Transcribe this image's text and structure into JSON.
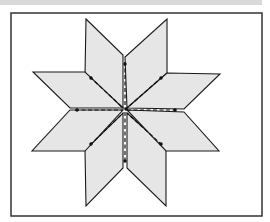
{
  "figure": {
    "frame": {
      "x": 11,
      "y": 13,
      "width": 251,
      "height": 203
    },
    "colors": {
      "background": "#ffffff",
      "top_strip": "#d9d9d9",
      "frame_stroke": "#333333",
      "diamond_fill": "#e6e6e6",
      "diamond_stroke": "#1a1a1a",
      "seam_stroke": "#111111"
    },
    "diamonds": [
      {
        "name": "diamond-upper-left-vertical",
        "points": "86,19 123,55 123,108 85,75"
      },
      {
        "name": "diamond-upper-right-vertical",
        "points": "167,19 167,73 127,108 125,57"
      },
      {
        "name": "diamond-lower-left-vertical",
        "points": "85,150 123,113 123,168 86,206"
      },
      {
        "name": "diamond-lower-right-vertical",
        "points": "127,113 166,148 166,206 127,168"
      },
      {
        "name": "diamond-upper-left-horizontal",
        "points": "33,72 85,72 123,108 70,108"
      },
      {
        "name": "diamond-upper-right-horizontal",
        "points": "167,73 220,74 184,109 127,108"
      },
      {
        "name": "diamond-lower-left-horizontal",
        "points": "70,110 123,110 85,151 32,151"
      },
      {
        "name": "diamond-lower-right-horizontal",
        "points": "127,110 184,112 219,151 166,151"
      }
    ],
    "seams": [
      {
        "name": "seam-vertical-top",
        "x1": 125,
        "y1": 62,
        "x2": 125,
        "y2": 108
      },
      {
        "name": "seam-vertical-bottom",
        "x1": 125,
        "y1": 112,
        "x2": 125,
        "y2": 163
      },
      {
        "name": "seam-horizontal-left",
        "x1": 75,
        "y1": 110,
        "x2": 123,
        "y2": 110
      },
      {
        "name": "seam-horizontal-right",
        "x1": 127,
        "y1": 110,
        "x2": 177,
        "y2": 110
      },
      {
        "name": "seam-diag-upper-left",
        "x1": 90,
        "y1": 77,
        "x2": 123,
        "y2": 108
      },
      {
        "name": "seam-diag-upper-right",
        "x1": 162,
        "y1": 77,
        "x2": 127,
        "y2": 108
      },
      {
        "name": "seam-diag-lower-left",
        "x1": 90,
        "y1": 145,
        "x2": 123,
        "y2": 113
      },
      {
        "name": "seam-diag-lower-right",
        "x1": 162,
        "y1": 145,
        "x2": 127,
        "y2": 113
      }
    ],
    "seam_ends": [
      {
        "cx": 125,
        "cy": 64
      },
      {
        "cx": 125,
        "cy": 161
      },
      {
        "cx": 77,
        "cy": 110
      },
      {
        "cx": 175,
        "cy": 110
      },
      {
        "cx": 91,
        "cy": 78
      },
      {
        "cx": 161,
        "cy": 78
      },
      {
        "cx": 91,
        "cy": 144
      },
      {
        "cx": 161,
        "cy": 144
      }
    ],
    "center": {
      "cx": 126,
      "cy": 109
    }
  }
}
